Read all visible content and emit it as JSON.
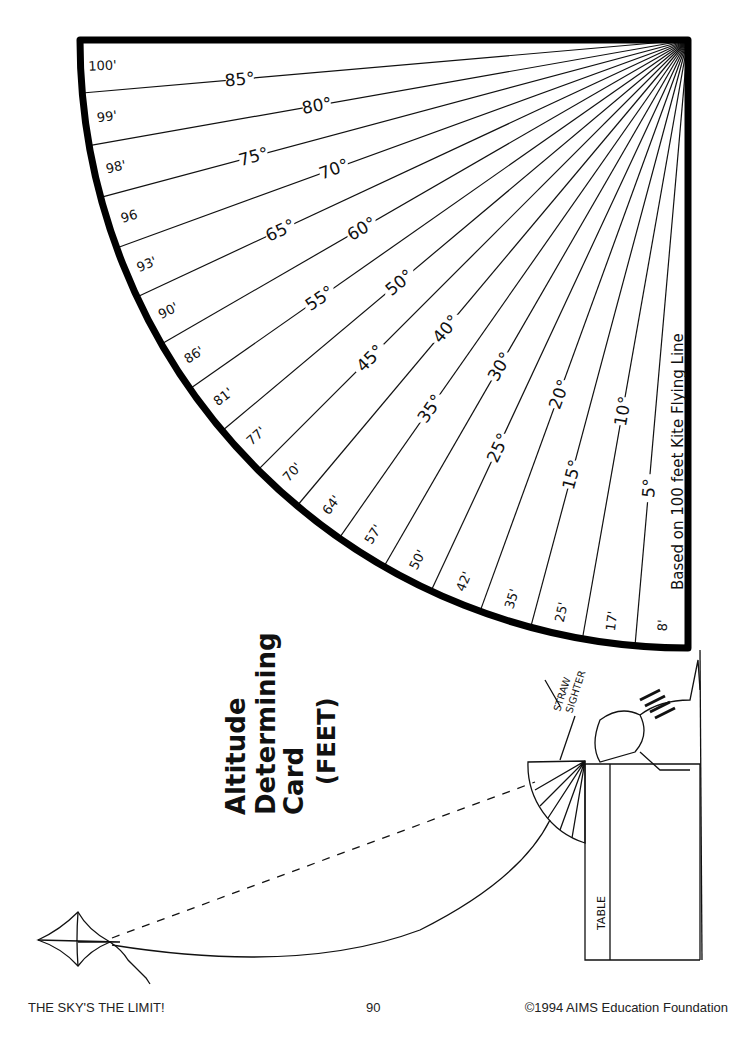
{
  "title": {
    "lines": [
      "Altitude",
      "Determining",
      "Card",
      "(FEET)"
    ]
  },
  "card": {
    "kite_line_length_ft": 100,
    "note": "Based on 100 feet Kite Flying Line",
    "angle_labels": [
      "5°",
      "10°",
      "15°",
      "20°",
      "25°",
      "30°",
      "35°",
      "40°",
      "45°",
      "50°",
      "55°",
      "60°",
      "65°",
      "70°",
      "75°",
      "80°",
      "85°"
    ],
    "angles_deg": [
      5,
      10,
      15,
      20,
      25,
      30,
      35,
      40,
      45,
      50,
      55,
      60,
      65,
      70,
      75,
      80,
      85
    ],
    "altitude_labels": [
      "8'",
      "17'",
      "25'",
      "35'",
      "42'",
      "50'",
      "57'",
      "64'",
      "70'",
      "77'",
      "81'",
      "86'",
      "90'",
      "93'",
      "96",
      "98'",
      "99'",
      "100'"
    ]
  },
  "illustration": {
    "straw_sighter_label": "STRAW SIGHTER",
    "straw_sighter_lines": [
      "STRAW",
      "SIGHTER"
    ],
    "table_label": "TABLE"
  },
  "footer": {
    "left": "THE SKY'S THE LIMIT!",
    "page_number": "90",
    "right": "©1994  AIMS Education Foundation"
  }
}
